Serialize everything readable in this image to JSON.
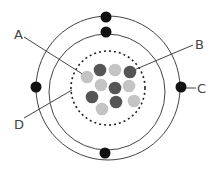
{
  "diagram": {
    "type": "atom-model",
    "labels": {
      "A": "A",
      "B": "B",
      "C": "C",
      "D": "D"
    },
    "colors": {
      "electron": "#111111",
      "proton": "#555555",
      "neutron": "#c4c4c4",
      "orbit": "#444444"
    },
    "nucleus": {
      "particles": [
        {
          "type": "neutron",
          "x": 87,
          "y": 77
        },
        {
          "type": "proton",
          "x": 100,
          "y": 70
        },
        {
          "type": "neutron",
          "x": 115,
          "y": 70
        },
        {
          "type": "proton",
          "x": 130,
          "y": 72
        },
        {
          "type": "neutron",
          "x": 101,
          "y": 85
        },
        {
          "type": "proton",
          "x": 115,
          "y": 88
        },
        {
          "type": "neutron",
          "x": 129,
          "y": 86
        },
        {
          "type": "proton",
          "x": 92,
          "y": 97
        },
        {
          "type": "proton",
          "x": 116,
          "y": 102
        },
        {
          "type": "neutron",
          "x": 134,
          "y": 101
        },
        {
          "type": "neutron",
          "x": 102,
          "y": 109
        }
      ]
    },
    "electrons": [
      {
        "shell": "outer",
        "x": 106,
        "y": 17
      },
      {
        "shell": "inner",
        "x": 106,
        "y": 32
      },
      {
        "shell": "outer",
        "x": 36,
        "y": 87
      },
      {
        "shell": "outer",
        "x": 181,
        "y": 87
      },
      {
        "shell": "inner",
        "x": 105,
        "y": 153
      }
    ]
  }
}
